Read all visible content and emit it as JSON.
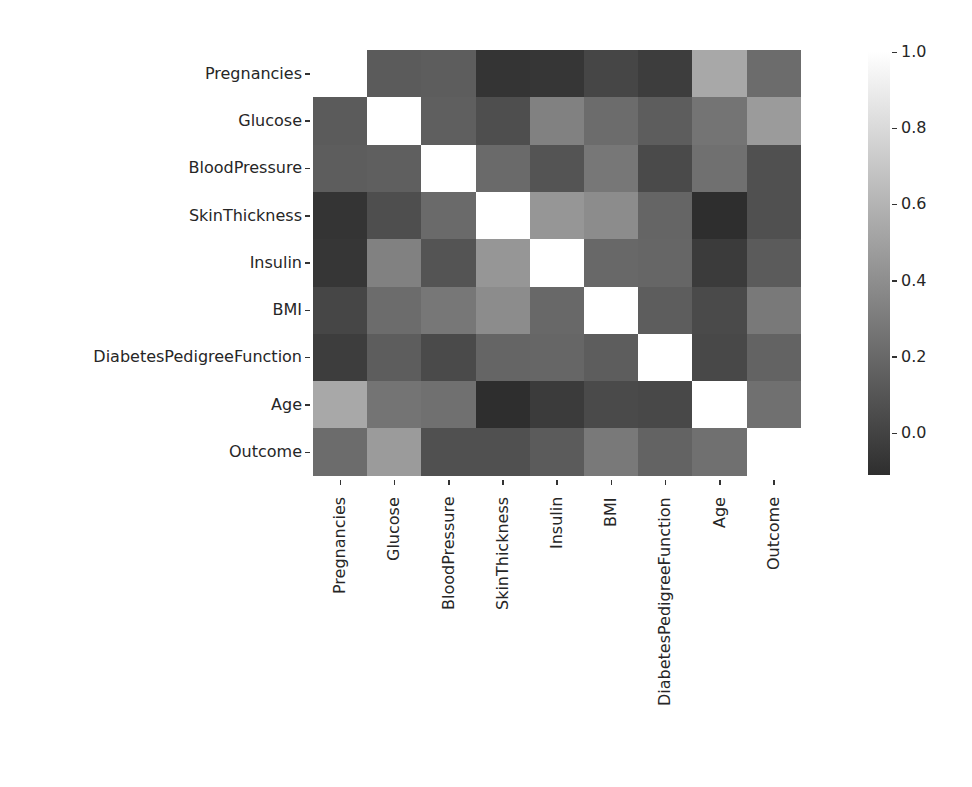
{
  "chart_data": {
    "type": "heatmap",
    "title": "",
    "xlabel": "",
    "ylabel": "",
    "colormap": "gray",
    "categories": [
      "Pregnancies",
      "Glucose",
      "BloodPressure",
      "SkinThickness",
      "Insulin",
      "BMI",
      "DiabetesPedigreeFunction",
      "Age",
      "Outcome"
    ],
    "x_labels": [
      "Pregnancies",
      "Glucose",
      "BloodPressure",
      "SkinThickness",
      "Insulin",
      "BMI",
      "DiabetesPedigreeFunction",
      "Age",
      "Outcome"
    ],
    "y_labels": [
      "Pregnancies",
      "Glucose",
      "BloodPressure",
      "SkinThickness",
      "Insulin",
      "BMI",
      "DiabetesPedigreeFunction",
      "Age",
      "Outcome"
    ],
    "matrix": [
      [
        1.0,
        0.13,
        0.14,
        -0.08,
        -0.07,
        0.02,
        -0.03,
        0.54,
        0.22
      ],
      [
        0.13,
        1.0,
        0.15,
        0.06,
        0.33,
        0.22,
        0.14,
        0.26,
        0.47
      ],
      [
        0.14,
        0.15,
        1.0,
        0.21,
        0.09,
        0.28,
        0.04,
        0.24,
        0.07
      ],
      [
        -0.08,
        0.06,
        0.21,
        1.0,
        0.44,
        0.39,
        0.18,
        -0.11,
        0.07
      ],
      [
        -0.07,
        0.33,
        0.09,
        0.44,
        1.0,
        0.2,
        0.19,
        -0.04,
        0.13
      ],
      [
        0.02,
        0.22,
        0.28,
        0.39,
        0.2,
        1.0,
        0.14,
        0.04,
        0.29
      ],
      [
        -0.03,
        0.14,
        0.04,
        0.18,
        0.19,
        0.14,
        1.0,
        0.03,
        0.17
      ],
      [
        0.54,
        0.26,
        0.24,
        -0.11,
        -0.04,
        0.04,
        0.03,
        1.0,
        0.24
      ],
      [
        0.22,
        0.47,
        0.07,
        0.07,
        0.13,
        0.29,
        0.17,
        0.24,
        1.0
      ]
    ],
    "colorbar": {
      "ticks": [
        "1.0",
        "0.8",
        "0.6",
        "0.4",
        "0.2",
        "0.0"
      ],
      "tick_values": [
        1.0,
        0.8,
        0.6,
        0.4,
        0.2,
        0.0
      ],
      "vmin": -0.11,
      "vmax": 1.0
    },
    "grid": false,
    "legend_position": "right (colorbar)"
  },
  "colors": {
    "low": "#2e2e2e",
    "high": "#ffffff",
    "text": "#262626"
  }
}
